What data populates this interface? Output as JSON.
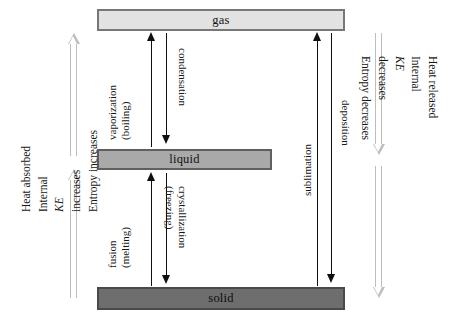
{
  "diagram": {
    "phases": [
      {
        "id": "gas",
        "label": "gas"
      },
      {
        "id": "liquid",
        "label": "liquid"
      },
      {
        "id": "solid",
        "label": "solid"
      }
    ],
    "transitions": [
      {
        "id": "vaporization",
        "line1": "vaporization",
        "line2": "(boiling)",
        "direction": "up",
        "from": "liquid",
        "to": "gas"
      },
      {
        "id": "condensation",
        "line1": "condensation",
        "line2": "",
        "direction": "down",
        "from": "gas",
        "to": "liquid"
      },
      {
        "id": "fusion",
        "line1": "fusion",
        "line2": "(melting)",
        "direction": "up",
        "from": "solid",
        "to": "liquid"
      },
      {
        "id": "crystallization",
        "line1": "crystallization",
        "line2": "(freezing)",
        "direction": "down",
        "from": "liquid",
        "to": "solid"
      },
      {
        "id": "sublimation",
        "line1": "sublimation",
        "line2": "",
        "direction": "up",
        "from": "solid",
        "to": "gas"
      },
      {
        "id": "deposition",
        "line1": "deposition",
        "line2": "",
        "direction": "down",
        "from": "gas",
        "to": "solid"
      }
    ],
    "left_annotation": {
      "id": "endothermic",
      "lines": [
        "Heat absorbed",
        "Internal KE increases",
        "Entropy increases"
      ],
      "line_prefix": [
        "Heat absorbed",
        "Internal ",
        "Entropy increases"
      ],
      "italic_term": "KE",
      "line_suffix": [
        " ",
        " increases",
        ""
      ],
      "arrow_direction": "up"
    },
    "right_annotation": {
      "id": "exothermic",
      "lines": [
        "Heat released",
        "Internal KE decreases",
        "Entropy decreases"
      ],
      "line_prefix": [
        "Heat released",
        "Internal ",
        "Entropy decreases"
      ],
      "italic_term": "KE",
      "line_suffix": [
        " ",
        " decreases",
        ""
      ],
      "arrow_direction": "down"
    },
    "colors": {
      "gas_fill": "#e2e2e2",
      "liquid_fill": "#a9a9a9",
      "solid_fill": "#6e6e6e",
      "box_border": "#6b6b6b",
      "arrow_black": "#0f0f0f",
      "arrow_gray": "#bdbdbd",
      "background": "#ffffff"
    }
  }
}
